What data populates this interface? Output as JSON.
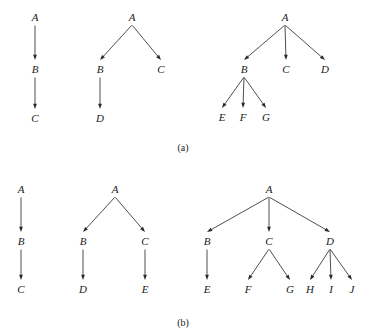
{
  "figure": {
    "background_color": "#ffffff",
    "ink_color": "#2a2a2a",
    "width": 367,
    "height": 336,
    "panels": [
      {
        "id": "panel-a",
        "caption": "(a)",
        "caption_x": 183,
        "caption_y": 151,
        "trees": [
          {
            "id": "a-tree-1",
            "nodes": [
              {
                "label": "A",
                "x": 35,
                "y": 21
              },
              {
                "label": "B",
                "x": 35,
                "y": 73
              },
              {
                "label": "C",
                "x": 35,
                "y": 122
              }
            ],
            "edges": [
              {
                "from": "A",
                "to": "B"
              },
              {
                "from": "B",
                "to": "C"
              }
            ]
          },
          {
            "id": "a-tree-2",
            "nodes": [
              {
                "label": "A",
                "x": 132,
                "y": 21
              },
              {
                "label": "B",
                "x": 100,
                "y": 73
              },
              {
                "label": "C",
                "x": 161,
                "y": 73
              },
              {
                "label": "D",
                "x": 100,
                "y": 122
              }
            ],
            "edges": [
              {
                "from": "A",
                "to": "B"
              },
              {
                "from": "A",
                "to": "C"
              },
              {
                "from": "B",
                "to": "D"
              }
            ]
          },
          {
            "id": "a-tree-3",
            "nodes": [
              {
                "label": "A",
                "x": 285,
                "y": 21
              },
              {
                "label": "B",
                "x": 244,
                "y": 73
              },
              {
                "label": "C",
                "x": 286,
                "y": 73
              },
              {
                "label": "D",
                "x": 325,
                "y": 73
              },
              {
                "label": "E",
                "x": 222,
                "y": 121
              },
              {
                "label": "F",
                "x": 243,
                "y": 121
              },
              {
                "label": "G",
                "x": 266,
                "y": 121
              }
            ],
            "edges": [
              {
                "from": "A",
                "to": "B"
              },
              {
                "from": "A",
                "to": "C"
              },
              {
                "from": "A",
                "to": "D"
              },
              {
                "from": "B",
                "to": "E"
              },
              {
                "from": "B",
                "to": "F"
              },
              {
                "from": "B",
                "to": "G"
              }
            ]
          }
        ]
      },
      {
        "id": "panel-b",
        "caption": "(b)",
        "caption_x": 183,
        "caption_y": 326,
        "trees": [
          {
            "id": "b-tree-1",
            "nodes": [
              {
                "label": "A",
                "x": 21,
                "y": 193
              },
              {
                "label": "B",
                "x": 21,
                "y": 245
              },
              {
                "label": "C",
                "x": 21,
                "y": 293
              }
            ],
            "edges": [
              {
                "from": "A",
                "to": "B"
              },
              {
                "from": "B",
                "to": "C"
              }
            ]
          },
          {
            "id": "b-tree-2",
            "nodes": [
              {
                "label": "A",
                "x": 115,
                "y": 193
              },
              {
                "label": "B",
                "x": 83,
                "y": 245
              },
              {
                "label": "C",
                "x": 145,
                "y": 245
              },
              {
                "label": "D",
                "x": 83,
                "y": 293
              },
              {
                "label": "E",
                "x": 145,
                "y": 293
              }
            ],
            "edges": [
              {
                "from": "A",
                "to": "B"
              },
              {
                "from": "A",
                "to": "C"
              },
              {
                "from": "B",
                "to": "D"
              },
              {
                "from": "C",
                "to": "E"
              }
            ]
          },
          {
            "id": "b-tree-3",
            "nodes": [
              {
                "label": "A",
                "x": 269,
                "y": 193
              },
              {
                "label": "B",
                "x": 207,
                "y": 245
              },
              {
                "label": "C",
                "x": 269,
                "y": 245
              },
              {
                "label": "D",
                "x": 330,
                "y": 245
              },
              {
                "label": "E",
                "x": 207,
                "y": 293
              },
              {
                "label": "F",
                "x": 248,
                "y": 293
              },
              {
                "label": "G",
                "x": 290,
                "y": 293
              },
              {
                "label": "H",
                "x": 310,
                "y": 293
              },
              {
                "label": "I",
                "x": 331,
                "y": 293
              },
              {
                "label": "J",
                "x": 352,
                "y": 293
              }
            ],
            "edges": [
              {
                "from": "A",
                "to": "B"
              },
              {
                "from": "A",
                "to": "C"
              },
              {
                "from": "A",
                "to": "D"
              },
              {
                "from": "B",
                "to": "E"
              },
              {
                "from": "C",
                "to": "F"
              },
              {
                "from": "C",
                "to": "G"
              },
              {
                "from": "D",
                "to": "H"
              },
              {
                "from": "D",
                "to": "I"
              },
              {
                "from": "D",
                "to": "J"
              }
            ]
          }
        ]
      }
    ]
  }
}
